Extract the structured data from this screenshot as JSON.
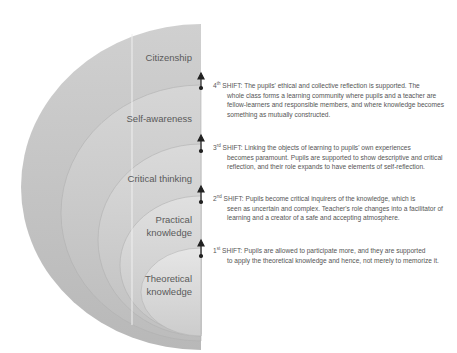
{
  "diagram": {
    "title": "",
    "levels": [
      {
        "label": "Citizenship"
      },
      {
        "label": "Self-awareness"
      },
      {
        "label": "Critical thinking"
      },
      {
        "label": "Practical knowledge",
        "line1": "Practical",
        "line2": "knowledge"
      },
      {
        "label": "Theoretical knowledge",
        "line1": "Theoretical",
        "line2": "knowledge"
      }
    ],
    "shifts": [
      {
        "ordinal": "4",
        "suffix": "th",
        "label": "SHIFT:",
        "line1": "The pupils' ethical and collective reflection is supported. The",
        "rest": "whole class forms a learning community where pupils and a teacher are fellow-learners and responsible members, and where knowledge becomes something as mutually constructed."
      },
      {
        "ordinal": "3",
        "suffix": "rd",
        "label": "SHIFT:",
        "line1": "Linking the objects of learning to pupils' own experiences",
        "rest": "becomes paramount. Pupils are supported to show descriptive and critical reflection, and their role expands to have elements of self-reflection."
      },
      {
        "ordinal": "2",
        "suffix": "nd",
        "label": "SHIFT:",
        "line1": "Pupils become critical inquirers of the knowledge, which is",
        "rest": "seen as uncertain and complex. Teacher's role changes into a facilitator of learning and a creator of a safe and accepting atmosphere."
      },
      {
        "ordinal": "1",
        "suffix": "st",
        "label": "SHIFT:",
        "line1": "Pupils are allowed to participate more, and they are supported",
        "rest": "to apply the theoretical knowledge and hence, not merely to memorize it."
      }
    ],
    "colors": {
      "outer": "#c4c4c4",
      "ring2": "#cdcdcd",
      "ring3": "#d5d5d5",
      "ring4": "#dcdcdc",
      "inner": "#e2e2e2",
      "text": "#555555",
      "arrow": "#222222"
    }
  }
}
